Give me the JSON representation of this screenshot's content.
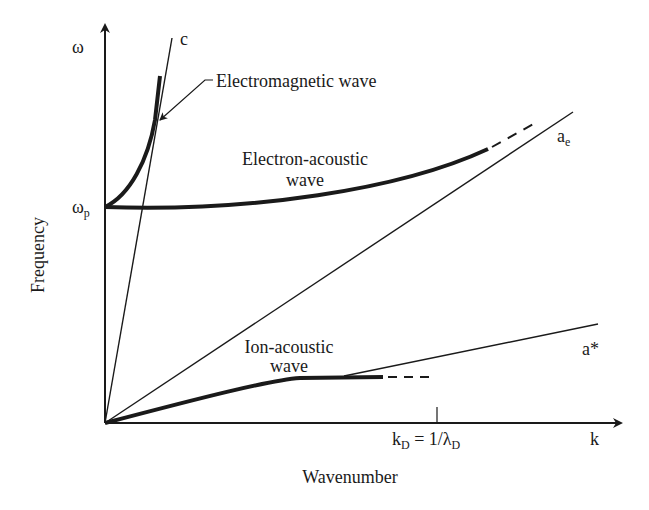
{
  "axes": {
    "y_symbol": "ω",
    "x_symbol": "k",
    "y_label": "Frequency",
    "x_label": "Wavenumber",
    "y_tick_label": "ω",
    "y_tick_sub": "p",
    "x_tick_label_main": "k",
    "x_tick_label_sub1": "D",
    "x_tick_label_mid": " = 1/λ",
    "x_tick_label_sub2": "D"
  },
  "lines": {
    "light": {
      "label": "c"
    },
    "electron_thermal": {
      "label": "a",
      "sub": "e"
    },
    "ion_sound": {
      "label": "a*"
    }
  },
  "curves": {
    "electromagnetic": {
      "label": "Electromagnetic wave"
    },
    "electron_acoustic": {
      "label_line1": "Electron-acoustic",
      "label_line2": "wave"
    },
    "ion_acoustic": {
      "label_line1": "Ion-acoustic",
      "label_line2": "wave"
    }
  },
  "geometry": {
    "origin": [
      105,
      423
    ],
    "y_axis_top": [
      105,
      25
    ],
    "x_axis_end": [
      621,
      423
    ],
    "omega_p_y": 207,
    "kD_x": 437,
    "c_line_end": [
      172,
      38
    ],
    "ae_line_end": [
      573,
      112
    ],
    "astar_line": [
      [
        344,
        376
      ],
      [
        598,
        324
      ]
    ],
    "em_curve": "M105,207 C130,195 148,160 155,120 L160,76",
    "ea_curve": "M105,207 C250,212 400,190 488,149",
    "ea_dash": [
      [
        492,
        147
      ],
      [
        537,
        122
      ]
    ],
    "ia_curve": "M105,423 C200,398 270,380 300,378 L383,377",
    "ia_dash": [
      [
        388,
        377
      ],
      [
        430,
        377
      ]
    ],
    "em_leader": "M213,80 L205,80 L160,120"
  },
  "colors": {
    "ink": "#1a1a1a",
    "background": "#ffffff"
  }
}
